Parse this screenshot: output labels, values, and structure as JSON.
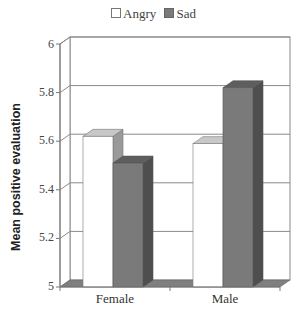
{
  "legend": {
    "items": [
      {
        "label": "Angry",
        "color": "#ffffff"
      },
      {
        "label": "Sad",
        "color": "#7a7a7a"
      }
    ]
  },
  "axes": {
    "ylabel": "Mean positive evaluation",
    "yticks": [
      "6",
      "5.8",
      "5.6",
      "5.4",
      "5.2",
      "5"
    ],
    "xticks": [
      "Female",
      "Male"
    ]
  },
  "chart_data": {
    "type": "bar",
    "title": "",
    "categories": [
      "Female",
      "Male"
    ],
    "series": [
      {
        "name": "Angry",
        "values": [
          5.62,
          5.59
        ],
        "color": "#ffffff"
      },
      {
        "name": "Sad",
        "values": [
          5.51,
          5.82
        ],
        "color": "#7a7a7a"
      }
    ],
    "xlabel": "",
    "ylabel": "Mean positive evaluation",
    "ylim": [
      5,
      6
    ],
    "yticks": [
      5,
      5.2,
      5.4,
      5.6,
      5.8,
      6
    ],
    "grid": true,
    "legend_position": "top",
    "style": "3d-clustered-column"
  }
}
